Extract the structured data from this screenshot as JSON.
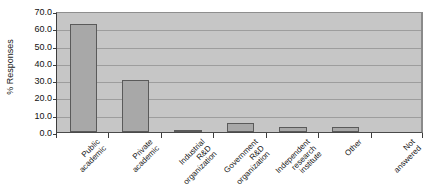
{
  "chart_data": {
    "type": "bar",
    "title": "",
    "xlabel": "",
    "ylabel": "% Responses",
    "ylim": [
      0,
      70
    ],
    "ytick_step": 10,
    "grid": true,
    "legend": "none",
    "categories": [
      "Public academic",
      "Private academic",
      "Industrial R&D organization",
      "Government R&D organization",
      "Independent research institute",
      "Other",
      "Not answered"
    ],
    "category_lines": [
      [
        "Public",
        "academic"
      ],
      [
        "Private",
        "academic"
      ],
      [
        "Industrial",
        "R&D",
        "organization"
      ],
      [
        "Government",
        "R&D",
        "organization"
      ],
      [
        "Independent",
        "research",
        "institute"
      ],
      [
        "Other"
      ],
      [
        "Not",
        "answered"
      ]
    ],
    "values": [
      62.5,
      30.0,
      0.8,
      5.0,
      3.0,
      3.0,
      0.0
    ],
    "ytick_labels": [
      "0.0",
      "10.0",
      "20.0",
      "30.0",
      "40.0",
      "50.0",
      "60.0",
      "70.0"
    ],
    "ytick_values": [
      0,
      10,
      20,
      30,
      40,
      50,
      60,
      70
    ],
    "colors": {
      "bar_fill": "#a8a8a8",
      "bar_border": "#5a5a5a",
      "plot_background": "#c6c6c6",
      "gridline": "#9d9d9d",
      "axis": "#3d3d3d",
      "text": "#161616",
      "page_background": "#ffffff"
    }
  }
}
